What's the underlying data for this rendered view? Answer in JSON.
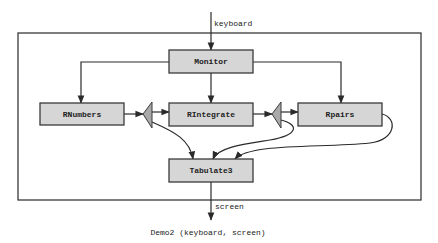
{
  "diagram": {
    "caption": "Demo2 (keyboard, screen)",
    "input_label": "keyboard",
    "output_label": "screen",
    "nodes": {
      "monitor": "Monitor",
      "rnumbers": "RNumbers",
      "rintegrate": "RIntegrate",
      "rpairs": "Rpairs",
      "tabulate3": "Tabulate3"
    },
    "edges": [
      {
        "from": "keyboard",
        "to": "Monitor"
      },
      {
        "from": "Monitor",
        "to": "RNumbers"
      },
      {
        "from": "Monitor",
        "to": "RIntegrate"
      },
      {
        "from": "Monitor",
        "to": "Rpairs"
      },
      {
        "from": "RNumbers",
        "to": "splitter-1"
      },
      {
        "from": "splitter-1",
        "to": "RIntegrate"
      },
      {
        "from": "splitter-1",
        "to": "Tabulate3"
      },
      {
        "from": "RIntegrate",
        "to": "splitter-2"
      },
      {
        "from": "splitter-2",
        "to": "Rpairs"
      },
      {
        "from": "splitter-2",
        "to": "Tabulate3"
      },
      {
        "from": "Rpairs",
        "to": "Tabulate3"
      },
      {
        "from": "Tabulate3",
        "to": "screen"
      }
    ],
    "colors": {
      "box_fill": "#d6d6d6",
      "splitter_fill": "#a9a9a9",
      "stroke": "#3a3a3a"
    }
  }
}
